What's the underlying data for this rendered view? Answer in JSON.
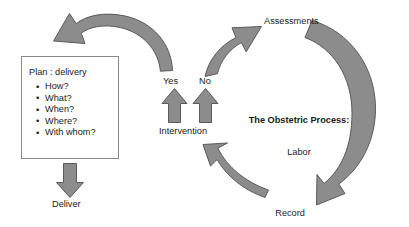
{
  "diagram": {
    "title": "The Obstetric Process: Labor",
    "colors": {
      "arrow_fill": "#8c8c8c",
      "arrow_stroke": "#5a5a5a",
      "box_stroke": "#8a8a8a",
      "text": "#1a1a1a",
      "background": "#ffffff"
    },
    "plan_box": {
      "title": "Plan : delivery",
      "bullet_glyph": "•",
      "items": [
        "How?",
        "What?",
        "When?",
        "Where?",
        "With whom?"
      ]
    },
    "center": {
      "line1": "The Obstetric Process:",
      "line2": "Labor"
    },
    "nodes": {
      "deliver": "Deliver",
      "assessments": "Assessments",
      "record_keeping_line1": "Record",
      "record_keeping_line2": "keeping",
      "intervention": "Intervention",
      "yes": "Yes",
      "no": "No"
    },
    "arrows": [
      {
        "name": "assessments-to-plan-arrow",
        "shape": "curved",
        "from": "Assessments",
        "to": "Plan : delivery"
      },
      {
        "name": "plan-to-deliver-arrow",
        "shape": "straight-down",
        "from": "Plan : delivery",
        "to": "Deliver"
      },
      {
        "name": "intervention-yes-arrow",
        "shape": "straight-up",
        "from": "Intervention",
        "to": "Yes"
      },
      {
        "name": "intervention-no-arrow",
        "shape": "straight-up",
        "from": "Intervention",
        "to": "No"
      },
      {
        "name": "no-to-assessments-arrow",
        "shape": "curved",
        "from": "No",
        "to": "Assessments"
      },
      {
        "name": "assessments-to-record-keeping-arrow",
        "shape": "curved",
        "from": "Assessments",
        "to": "Record keeping"
      },
      {
        "name": "record-keeping-to-intervention-arrow",
        "shape": "curved",
        "from": "Record keeping",
        "to": "Intervention"
      }
    ]
  }
}
